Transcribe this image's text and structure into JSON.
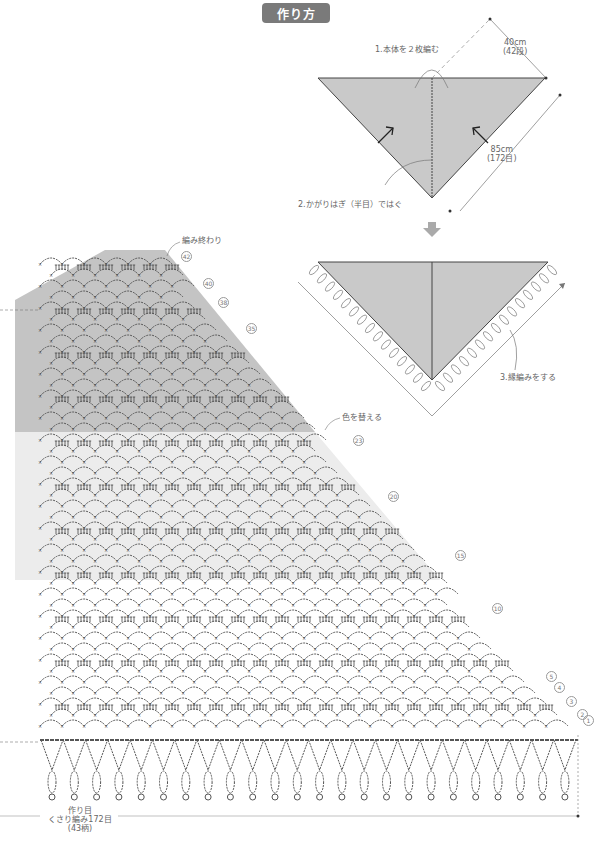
{
  "title": "作り方",
  "schematic": {
    "step1_label": "1.本体を２枚編む",
    "step2_label": "2.かがりはぎ（半目）ではぐ",
    "step3_label": "3.縁編みをする",
    "width_dim": {
      "cm": "40cm",
      "rows": "(42段)"
    },
    "edge_dim": {
      "cm": "85cm",
      "stitches": "(172目)"
    },
    "fill_color": "#c9c9c9",
    "arrow_icon": "down-arrow"
  },
  "chart": {
    "end_label": "編み終わり",
    "color_change_label": "色を替える",
    "start_label": {
      "line1": "作り目",
      "line2": "くさり編み172目",
      "line3": "(43柄)"
    },
    "row_markers": [
      {
        "num": "42",
        "x": 181,
        "y": 256
      },
      {
        "num": "40",
        "x": 203,
        "y": 283
      },
      {
        "num": "38",
        "x": 218,
        "y": 302
      },
      {
        "num": "35",
        "x": 246,
        "y": 328
      },
      {
        "num": "23",
        "x": 353,
        "y": 440
      },
      {
        "num": "20",
        "x": 388,
        "y": 496
      },
      {
        "num": "15",
        "x": 455,
        "y": 555
      },
      {
        "num": "10",
        "x": 492,
        "y": 608
      },
      {
        "num": "5",
        "x": 546,
        "y": 676
      },
      {
        "num": "4",
        "x": 554,
        "y": 687
      },
      {
        "num": "3",
        "x": 566,
        "y": 701
      },
      {
        "num": "2",
        "x": 577,
        "y": 714
      },
      {
        "num": "1",
        "x": 583,
        "y": 720
      }
    ],
    "band_colors": {
      "dark": "#c4c4c4",
      "light": "#ececec"
    },
    "fringe_count": 24
  }
}
